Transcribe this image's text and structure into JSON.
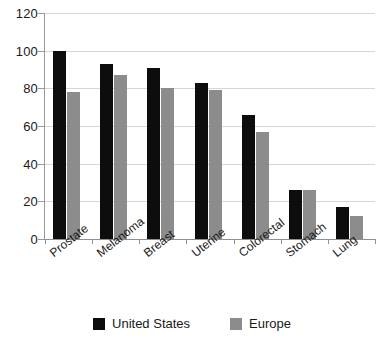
{
  "chart_data": {
    "type": "bar",
    "title": "",
    "subtitle": "",
    "xlabel": "",
    "ylabel": "",
    "ylim": [
      0,
      120
    ],
    "yticks": [
      0,
      20,
      40,
      60,
      80,
      100,
      120
    ],
    "grid": true,
    "legend_position": "bottom-center",
    "categories": [
      "Prostate",
      "Melanoma",
      "Breast",
      "Uterine",
      "Colorectal",
      "Stomach",
      "Lung"
    ],
    "series": [
      {
        "name": "United States",
        "color": "#0d0d0d",
        "values": [
          100,
          93,
          91,
          83,
          66,
          26,
          17
        ]
      },
      {
        "name": "Europe",
        "color": "#8c8c8c",
        "values": [
          78,
          87,
          80,
          79,
          57,
          26,
          12
        ]
      }
    ]
  },
  "legend": {
    "items": [
      {
        "label": "United States",
        "swatch": "us"
      },
      {
        "label": "Europe",
        "swatch": "eu"
      }
    ]
  },
  "footer": {
    "note": ""
  },
  "colors": {
    "united_states": "#0d0d0d",
    "europe": "#8c8c8c",
    "gridline": "#d6d6d6",
    "axis": "#8f8f8f",
    "background": "#ffffff"
  }
}
